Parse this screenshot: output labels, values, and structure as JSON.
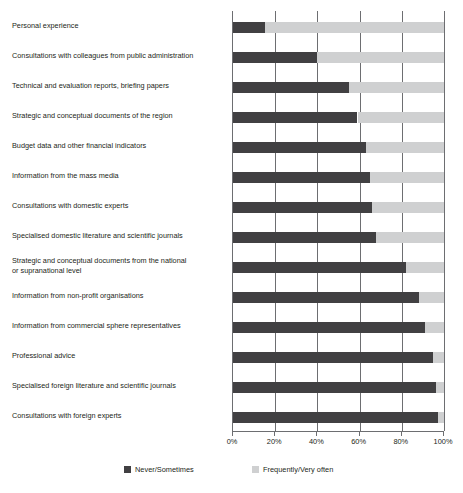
{
  "chart_data": {
    "type": "bar",
    "subtype": "stacked-horizontal-100-percent",
    "title": "",
    "xlabel": "",
    "ylabel": "",
    "xlim": [
      0,
      100
    ],
    "xticks": [
      "0%",
      "20%",
      "40%",
      "60%",
      "80%",
      "100%"
    ],
    "xtick_values": [
      0,
      20,
      40,
      60,
      80,
      100
    ],
    "grid": true,
    "grid_axis": "x",
    "legend_position": "bottom",
    "categories": [
      "Personal experience",
      "Consultations with colleagues from public administration",
      "Technical and evaluation reports, briefing papers",
      "Strategic and conceptual documents of the region",
      "Budget data and other financial indicators",
      "Information from the mass media",
      "Consultations with domestic experts",
      "Specialised domestic literature and scientific journals",
      "Strategic and conceptual documents from the national\n    or supranational level",
      "Information from non-profit organisations",
      "Information from commercial sphere representatives",
      "Professional advice",
      "Specialised foreign literature and scientific journals",
      "Consultations with foreign experts"
    ],
    "series": [
      {
        "name": "Never/Sometimes",
        "color": "#414042",
        "values": [
          15,
          40,
          55,
          59,
          63,
          65,
          66,
          68,
          82,
          88,
          91,
          95,
          96,
          97
        ]
      },
      {
        "name": "Frequently/Very often",
        "color": "#cfd0d1",
        "values": [
          85,
          60,
          45,
          41,
          37,
          35,
          34,
          32,
          18,
          12,
          9,
          5,
          4,
          3
        ]
      }
    ]
  },
  "legend": {
    "items": [
      {
        "label": "Never/Sometimes",
        "swatch": "dark-square-swatch"
      },
      {
        "label": "Frequently/Very often",
        "swatch": "light-square-swatch"
      }
    ]
  },
  "axis": {
    "tick_labels": [
      "0%",
      "20%",
      "40%",
      "60%",
      "80%",
      "100%"
    ]
  }
}
